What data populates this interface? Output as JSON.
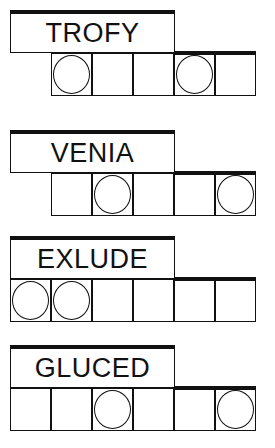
{
  "puzzles": [
    {
      "word": "TROFY",
      "top": 10,
      "cells_start_x": 51,
      "cells": [
        true,
        false,
        false,
        true,
        false
      ]
    },
    {
      "word": "VENIA",
      "top": 130,
      "cells_start_x": 51,
      "cells": [
        false,
        true,
        false,
        false,
        true
      ]
    },
    {
      "word": "EXLUDE",
      "top": 236,
      "cells_start_x": 10,
      "cells": [
        true,
        true,
        false,
        false,
        false,
        false
      ]
    },
    {
      "word": "GLUCED",
      "top": 345,
      "cells_start_x": 10,
      "cells": [
        false,
        false,
        true,
        false,
        false,
        true
      ]
    }
  ]
}
